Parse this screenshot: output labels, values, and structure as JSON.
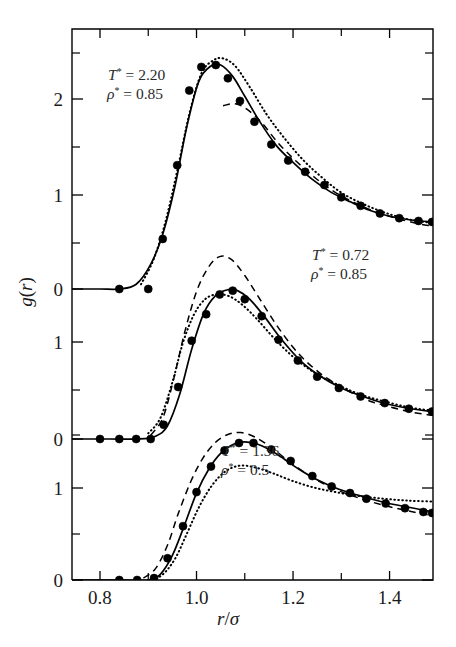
{
  "figure": {
    "background_color": "#ffffff",
    "ink_color": "#000000"
  },
  "axes": {
    "xlabel_r": "r",
    "xlabel_slash": "/",
    "xlabel_sigma": "σ",
    "ylabel_g": "g",
    "ylabel_paren_open": "(",
    "ylabel_r": "r",
    "ylabel_paren_close": ")",
    "x_ticklabels": [
      "0.8",
      "1.0",
      "1.2",
      "1.4"
    ],
    "x_tickvalues": [
      0.8,
      1.0,
      1.2,
      1.4
    ],
    "x_minor_tickvalues": [
      0.9,
      1.1,
      1.3,
      1.5
    ],
    "xlim": [
      0.742,
      1.49
    ],
    "y_ticklabels": [
      "2",
      "1",
      "0",
      "1",
      "0",
      "1",
      "0"
    ],
    "y_tick_pixels": [
      99,
      195,
      289,
      342,
      439,
      488,
      580
    ],
    "y_minor_tick_pixels": [
      53,
      147,
      243,
      390,
      435,
      534
    ]
  },
  "chart_data": {
    "type": "line",
    "title": "",
    "xlabel": "r/σ",
    "ylabel": "g(r)",
    "xlim": [
      0.742,
      1.49
    ],
    "grid": false,
    "legend_position": "none",
    "note": "Radial distribution function g(r) for three thermodynamic state points, plotted as three vertically offset panels sharing a common r/sigma axis. Each panel shows simulation data points plus three theoretical curves (solid, dashed, dotted).",
    "panels": [
      {
        "panel_id": "top",
        "annotation": {
          "T_symbol": "T",
          "T_star": "*",
          "T_eq": "=",
          "T_value": "2.20",
          "rho_symbol": "ρ",
          "rho_star": "*",
          "rho_eq": "=",
          "rho_value": "0.85"
        },
        "ylim": [
          0,
          2.6
        ],
        "y_ticks": [
          0,
          1,
          2
        ],
        "series": [
          {
            "name": "simulation-points",
            "style": "points",
            "x": [
              0.84,
              0.9,
              0.93,
              0.96,
              0.985,
              1.01,
              1.04,
              1.065,
              1.09,
              1.12,
              1.155,
              1.19,
              1.225,
              1.265,
              1.3,
              1.34,
              1.38,
              1.42,
              1.46,
              1.488
            ],
            "y": [
              0.0,
              0.0,
              0.53,
              1.31,
              2.1,
              2.35,
              2.37,
              2.23,
              1.99,
              1.77,
              1.53,
              1.36,
              1.24,
              1.1,
              0.97,
              0.88,
              0.8,
              0.75,
              0.72,
              0.71
            ]
          },
          {
            "name": "solid-theory",
            "style": "solid",
            "x": [
              0.742,
              0.8,
              0.84,
              0.875,
              0.905,
              0.93,
              0.955,
              0.98,
              1.005,
              1.03,
              1.05,
              1.075,
              1.1,
              1.13,
              1.165,
              1.2,
              1.24,
              1.28,
              1.32,
              1.36,
              1.4,
              1.445,
              1.49
            ],
            "y": [
              0.0,
              0.0,
              0.0,
              0.05,
              0.26,
              0.58,
              1.08,
              1.72,
              2.2,
              2.36,
              2.37,
              2.25,
              2.04,
              1.78,
              1.52,
              1.34,
              1.16,
              1.02,
              0.92,
              0.83,
              0.77,
              0.73,
              0.71
            ]
          },
          {
            "name": "dotted-theory",
            "style": "dotted",
            "x": [
              0.885,
              0.91,
              0.935,
              0.96,
              0.985,
              1.01,
              1.035,
              1.055,
              1.08,
              1.11,
              1.145,
              1.18,
              1.22,
              1.26,
              1.3,
              1.345,
              1.395,
              1.445,
              1.49
            ],
            "y": [
              0.05,
              0.3,
              0.7,
              1.25,
              1.85,
              2.28,
              2.42,
              2.44,
              2.36,
              2.14,
              1.85,
              1.61,
              1.37,
              1.18,
              1.02,
              0.9,
              0.8,
              0.73,
              0.7
            ]
          },
          {
            "name": "dashed-theory",
            "style": "dashed",
            "x": [
              1.055,
              1.08,
              1.105,
              1.135,
              1.17,
              1.205,
              1.245,
              1.285,
              1.325,
              1.37,
              1.42,
              1.47,
              1.49
            ],
            "y": [
              1.94,
              1.96,
              1.9,
              1.76,
              1.54,
              1.36,
              1.18,
              1.03,
              0.92,
              0.82,
              0.74,
              0.68,
              0.67
            ]
          }
        ]
      },
      {
        "panel_id": "middle",
        "annotation": {
          "T_symbol": "T",
          "T_star": "*",
          "T_eq": "=",
          "T_value": "0.72",
          "rho_symbol": "ρ",
          "rho_star": "*",
          "rho_eq": "=",
          "rho_value": "0.85"
        },
        "ylim": [
          0,
          1.75
        ],
        "y_ticks": [
          0,
          1
        ],
        "series": [
          {
            "name": "simulation-points",
            "style": "points",
            "x": [
              0.8,
              0.84,
              0.875,
              0.905,
              0.932,
              0.962,
              0.99,
              1.02,
              1.048,
              1.075,
              1.1,
              1.135,
              1.17,
              1.21,
              1.25,
              1.295,
              1.34,
              1.39,
              1.44,
              1.488
            ],
            "y": [
              0.0,
              0.0,
              0.0,
              0.0,
              0.15,
              0.55,
              1.04,
              1.32,
              1.53,
              1.57,
              1.48,
              1.3,
              1.05,
              0.83,
              0.66,
              0.54,
              0.45,
              0.38,
              0.32,
              0.29
            ]
          },
          {
            "name": "solid-theory",
            "style": "solid",
            "x": [
              0.742,
              0.82,
              0.88,
              0.915,
              0.94,
              0.965,
              0.99,
              1.015,
              1.04,
              1.065,
              1.085,
              1.11,
              1.14,
              1.175,
              1.215,
              1.255,
              1.3,
              1.345,
              1.395,
              1.445,
              1.49
            ],
            "y": [
              0.0,
              0.0,
              0.0,
              0.03,
              0.14,
              0.47,
              0.95,
              1.33,
              1.52,
              1.58,
              1.57,
              1.48,
              1.3,
              1.06,
              0.83,
              0.67,
              0.54,
              0.45,
              0.37,
              0.32,
              0.29
            ]
          },
          {
            "name": "dotted-theory",
            "style": "dotted",
            "x": [
              0.9,
              0.925,
              0.95,
              0.972,
              0.995,
              1.018,
              1.042,
              1.068,
              1.095,
              1.125,
              1.16,
              1.2,
              1.245,
              1.29,
              1.34,
              1.395,
              1.445,
              1.49
            ],
            "y": [
              0.06,
              0.22,
              0.6,
              1.02,
              1.32,
              1.48,
              1.53,
              1.51,
              1.42,
              1.27,
              1.07,
              0.87,
              0.7,
              0.58,
              0.47,
              0.39,
              0.33,
              0.3
            ]
          },
          {
            "name": "dashed-theory",
            "style": "dashed",
            "x": [
              0.905,
              0.93,
              0.952,
              0.975,
              1.0,
              1.025,
              1.048,
              1.072,
              1.1,
              1.135,
              1.172,
              1.212,
              1.255,
              1.3,
              1.35,
              1.4,
              1.45,
              1.49
            ],
            "y": [
              0.04,
              0.22,
              0.62,
              1.12,
              1.56,
              1.82,
              1.93,
              1.9,
              1.73,
              1.45,
              1.16,
              0.9,
              0.7,
              0.55,
              0.42,
              0.34,
              0.28,
              0.25
            ]
          }
        ]
      },
      {
        "panel_id": "bottom",
        "annotation": {
          "T_symbol": "T",
          "T_star": "*",
          "T_eq": "=",
          "T_value": "1.36",
          "rho_symbol": "ρ",
          "rho_star": "*",
          "rho_eq": "=",
          "rho_value": "0.5"
        },
        "ylim": [
          0,
          1.55
        ],
        "y_ticks": [
          0,
          1
        ],
        "series": [
          {
            "name": "simulation-points",
            "style": "points",
            "x": [
              0.84,
              0.877,
              0.912,
              0.94,
              0.972,
              1.0,
              1.03,
              1.058,
              1.088,
              1.118,
              1.155,
              1.195,
              1.24,
              1.28,
              1.318,
              1.352,
              1.392,
              1.432,
              1.47,
              1.488
            ],
            "y": [
              0.0,
              0.0,
              0.02,
              0.23,
              0.57,
              0.93,
              1.2,
              1.37,
              1.45,
              1.45,
              1.38,
              1.26,
              1.1,
              0.99,
              0.92,
              0.86,
              0.81,
              0.76,
              0.72,
              0.71
            ]
          },
          {
            "name": "solid-theory",
            "style": "solid",
            "x": [
              0.742,
              0.85,
              0.9,
              0.925,
              0.95,
              0.975,
              1.0,
              1.025,
              1.05,
              1.078,
              1.105,
              1.135,
              1.17,
              1.21,
              1.25,
              1.295,
              1.34,
              1.39,
              1.44,
              1.49
            ],
            "y": [
              0.0,
              0.0,
              0.0,
              0.06,
              0.26,
              0.58,
              0.92,
              1.17,
              1.34,
              1.44,
              1.46,
              1.42,
              1.32,
              1.18,
              1.06,
              0.96,
              0.89,
              0.82,
              0.77,
              0.72
            ]
          },
          {
            "name": "dashed-theory",
            "style": "dashed",
            "x": [
              0.89,
              0.915,
              0.94,
              0.962,
              0.988,
              1.012,
              1.038,
              1.065,
              1.092,
              1.122,
              1.158,
              1.198,
              1.242,
              1.288,
              1.335,
              1.388,
              1.44,
              1.49
            ],
            "y": [
              0.02,
              0.12,
              0.37,
              0.7,
              1.04,
              1.28,
              1.45,
              1.54,
              1.56,
              1.51,
              1.39,
              1.23,
              1.08,
              0.96,
              0.87,
              0.79,
              0.73,
              0.68
            ]
          },
          {
            "name": "dotted-theory",
            "style": "dotted",
            "x": [
              0.9,
              0.928,
              0.955,
              0.98,
              1.005,
              1.032,
              1.06,
              1.09,
              1.122,
              1.158,
              1.198,
              1.242,
              1.288,
              1.335,
              1.388,
              1.44,
              1.49
            ],
            "y": [
              0.0,
              0.05,
              0.22,
              0.49,
              0.77,
              1.0,
              1.15,
              1.21,
              1.19,
              1.13,
              1.05,
              0.98,
              0.93,
              0.89,
              0.86,
              0.84,
              0.83
            ]
          }
        ]
      }
    ]
  }
}
